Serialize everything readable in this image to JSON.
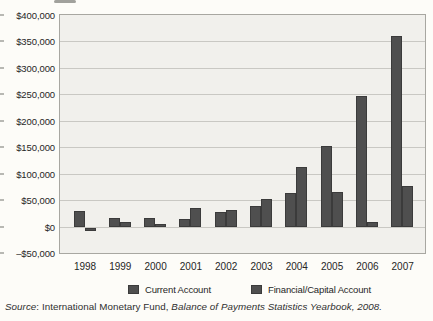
{
  "chart_data": {
    "type": "bar",
    "title": "",
    "categories": [
      "1998",
      "1999",
      "2000",
      "2001",
      "2002",
      "2003",
      "2004",
      "2005",
      "2006",
      "2007"
    ],
    "series": [
      {
        "name": "Current Account",
        "values": [
          30000,
          16000,
          17000,
          14000,
          28000,
          38000,
          63000,
          152000,
          247000,
          360000
        ]
      },
      {
        "name": "Financial/Capital Account",
        "values": [
          -6000,
          8000,
          4000,
          35000,
          32000,
          53000,
          112000,
          65000,
          8000,
          76000
        ]
      }
    ],
    "xlabel": "",
    "ylabel": "",
    "ylim": [
      -50000,
      400000
    ],
    "ytick_step": 50000,
    "ytick_labels": [
      "$400,000",
      "$350,000",
      "$300,000",
      "$250,000",
      "$200,000",
      "$150,000",
      "$100,000",
      "$50,000",
      "$0",
      "–$50,000"
    ],
    "grid": true,
    "legend_position": "bottom",
    "colors": {
      "bar_fill": "#4f4f4f",
      "bar_border": "#3b3b3b",
      "plot_background": "#f1f0ec",
      "grid_line": "#c9c8c3",
      "plot_border": "#a8a7a1",
      "text": "#2a2a2a"
    }
  },
  "source": {
    "prefix_italic": "Source",
    "middle": ": International Monetary Fund, ",
    "title_italic": "Balance of Payments Statistics Yearbook, 2008."
  }
}
